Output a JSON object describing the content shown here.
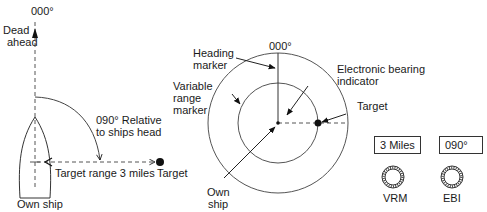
{
  "left_diagram": {
    "bearing_label": "000°",
    "dead_ahead": [
      "Dead",
      "ahead"
    ],
    "relative_bearing": [
      "090° Relative",
      "to ships head"
    ],
    "range_label": "Target range 3 miles",
    "target_label": "Target",
    "own_ship_label": "Own ship"
  },
  "radar_display": {
    "bearing_label": "000°",
    "heading_marker": [
      "Heading",
      "marker"
    ],
    "variable_range_marker": [
      "Variable",
      "range",
      "marker"
    ],
    "ebi": [
      "Electronic bearing",
      "indicator"
    ],
    "target_label": "Target",
    "own_ship": [
      "Own",
      "ship"
    ]
  },
  "controls": {
    "vrm": {
      "readout": "3 Miles",
      "label": "VRM"
    },
    "ebi": {
      "readout": "090°",
      "label": "EBI"
    }
  }
}
